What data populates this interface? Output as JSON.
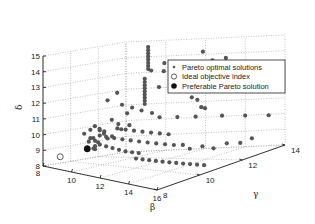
{
  "chart_data": {
    "type": "scatter",
    "projection": "3d",
    "title": "",
    "xlabel": "β",
    "ylabel": "γ",
    "zlabel": "δ",
    "xlim": [
      8,
      16
    ],
    "ylim": [
      8,
      14
    ],
    "zlim": [
      8,
      15
    ],
    "xticks": [
      8,
      10,
      12,
      14,
      16
    ],
    "yticks": [
      8,
      10,
      12,
      14
    ],
    "zticks": [
      8,
      9,
      10,
      11,
      12,
      13,
      14,
      15
    ],
    "grid": true,
    "legend": {
      "position": "upper right",
      "entries": [
        {
          "label": "Pareto optimal solutions",
          "marker": "small-dot"
        },
        {
          "label": "Ideal objective index",
          "marker": "open-circle"
        },
        {
          "label": "Preferable Pareto solution",
          "marker": "filled-circle"
        }
      ]
    },
    "series": [
      {
        "name": "Pareto optimal solutions",
        "color": "#555555",
        "points": [
          [
            9.9,
            13.0,
            14.8
          ],
          [
            9.9,
            13.0,
            14.6
          ],
          [
            9.9,
            13.0,
            14.4
          ],
          [
            9.9,
            13.0,
            14.2
          ],
          [
            9.9,
            13.0,
            14.0
          ],
          [
            9.9,
            13.0,
            13.8
          ],
          [
            9.9,
            13.0,
            13.6
          ],
          [
            9.9,
            13.0,
            13.4
          ],
          [
            9.8,
            12.9,
            12.8
          ],
          [
            9.8,
            12.9,
            12.6
          ],
          [
            9.8,
            12.9,
            12.4
          ],
          [
            9.8,
            12.9,
            12.2
          ],
          [
            9.8,
            12.9,
            12.0
          ],
          [
            9.8,
            12.9,
            11.8
          ],
          [
            9.8,
            12.9,
            11.6
          ],
          [
            9.8,
            12.9,
            11.4
          ],
          [
            9.8,
            12.9,
            11.2
          ],
          [
            10.4,
            12.6,
            13.4
          ],
          [
            10.9,
            12.8,
            13.3
          ],
          [
            11.2,
            12.5,
            13.9
          ],
          [
            11.6,
            12.8,
            13.0
          ],
          [
            11.0,
            12.4,
            12.4
          ],
          [
            12.6,
            13.2,
            14.4
          ],
          [
            12.9,
            13.1,
            13.6
          ],
          [
            13.0,
            13.3,
            13.8
          ],
          [
            13.2,
            13.0,
            13.2
          ],
          [
            13.6,
            13.4,
            13.9
          ],
          [
            12.3,
            12.9,
            11.6
          ],
          [
            12.5,
            13.0,
            11.4
          ],
          [
            12.9,
            12.8,
            11.0
          ],
          [
            13.0,
            12.9,
            10.9
          ],
          [
            9.5,
            10.0,
            10.4
          ],
          [
            9.6,
            10.2,
            10.2
          ],
          [
            9.7,
            10.4,
            10.0
          ],
          [
            9.5,
            10.6,
            9.8
          ],
          [
            9.8,
            10.8,
            9.6
          ],
          [
            9.6,
            11.0,
            10.6
          ],
          [
            9.8,
            11.2,
            10.3
          ],
          [
            9.7,
            11.5,
            9.9
          ],
          [
            9.9,
            11.8,
            10.1
          ],
          [
            9.6,
            12.0,
            10.8
          ],
          [
            9.5,
            9.6,
            9.5
          ],
          [
            9.6,
            9.8,
            9.7
          ],
          [
            9.7,
            10.0,
            9.4
          ],
          [
            9.8,
            9.4,
            9.8
          ],
          [
            9.9,
            9.6,
            9.6
          ],
          [
            10.0,
            9.8,
            9.9
          ],
          [
            9.6,
            9.2,
            10.1
          ],
          [
            9.7,
            9.5,
            10.3
          ],
          [
            9.9,
            9.9,
            10.2
          ],
          [
            10.0,
            10.3,
            9.6
          ],
          [
            10.2,
            10.0,
            9.8
          ],
          [
            10.5,
            10.2,
            9.7
          ],
          [
            10.8,
            10.4,
            9.6
          ],
          [
            11.1,
            10.6,
            9.5
          ],
          [
            11.4,
            10.8,
            9.4
          ],
          [
            11.7,
            11.0,
            9.3
          ],
          [
            12.0,
            11.2,
            9.2
          ],
          [
            12.3,
            11.4,
            9.1
          ],
          [
            12.6,
            11.6,
            9.0
          ],
          [
            12.9,
            11.8,
            8.95
          ],
          [
            10.3,
            10.6,
            10.2
          ],
          [
            10.6,
            10.8,
            10.1
          ],
          [
            10.9,
            11.0,
            10.0
          ],
          [
            11.2,
            11.2,
            9.9
          ],
          [
            11.5,
            11.4,
            9.8
          ],
          [
            11.8,
            11.6,
            9.7
          ],
          [
            12.1,
            11.8,
            9.6
          ],
          [
            10.2,
            9.6,
            9.4
          ],
          [
            10.5,
            9.7,
            9.3
          ],
          [
            10.8,
            9.8,
            9.2
          ],
          [
            11.1,
            9.9,
            9.1
          ],
          [
            11.4,
            10.0,
            9.0
          ],
          [
            11.7,
            10.1,
            8.95
          ],
          [
            12.0,
            10.2,
            8.9
          ],
          [
            12.5,
            9.6,
            8.8
          ],
          [
            12.8,
            9.7,
            8.75
          ],
          [
            13.1,
            9.8,
            8.7
          ],
          [
            13.4,
            9.9,
            8.65
          ],
          [
            13.7,
            10.0,
            8.6
          ],
          [
            14.0,
            10.1,
            8.55
          ],
          [
            14.3,
            10.2,
            8.5
          ],
          [
            14.6,
            10.3,
            8.45
          ],
          [
            14.9,
            10.4,
            8.4
          ],
          [
            15.2,
            10.5,
            8.35
          ],
          [
            15.5,
            10.6,
            8.3
          ],
          [
            13.5,
            11.6,
            8.8
          ],
          [
            14.0,
            11.8,
            8.9
          ],
          [
            14.4,
            12.0,
            8.7
          ],
          [
            14.8,
            12.3,
            8.9
          ],
          [
            15.2,
            12.6,
            8.8
          ],
          [
            15.6,
            12.8,
            9.0
          ],
          [
            10.4,
            12.0,
            11.0
          ],
          [
            10.8,
            12.2,
            10.8
          ],
          [
            11.4,
            12.0,
            10.6
          ],
          [
            12.0,
            12.4,
            10.5
          ],
          [
            12.6,
            12.8,
            10.4
          ],
          [
            13.6,
            13.2,
            10.3
          ],
          [
            14.6,
            13.4,
            10.2
          ],
          [
            15.6,
            13.6,
            10.1
          ],
          [
            10.2,
            11.0,
            11.6
          ],
          [
            10.6,
            11.2,
            11.4
          ],
          [
            9.9,
            10.4,
            12.0
          ],
          [
            10.1,
            10.8,
            12.4
          ],
          [
            9.6,
            9.4,
            9.2
          ],
          [
            9.8,
            9.6,
            9.1
          ],
          [
            10.0,
            9.5,
            9.3
          ],
          [
            9.7,
            9.8,
            9.0
          ]
        ]
      },
      {
        "name": "Ideal objective index",
        "color": "#333333",
        "points": [
          [
            8.6,
            8.6,
            8.6
          ]
        ]
      },
      {
        "name": "Preferable Pareto solution",
        "color": "#111111",
        "points": [
          [
            9.6,
            9.4,
            9.1
          ]
        ]
      }
    ]
  }
}
